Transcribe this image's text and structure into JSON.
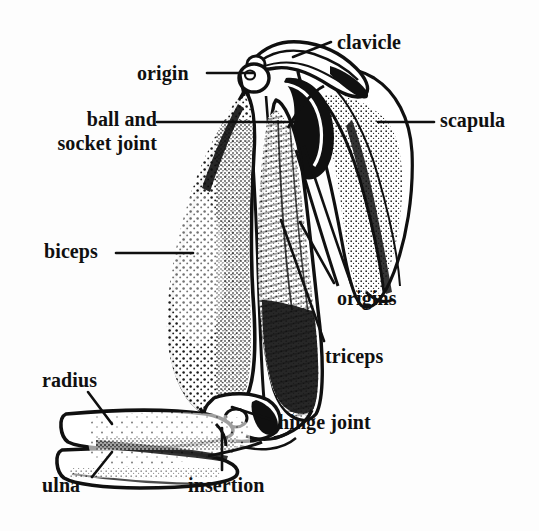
{
  "figure": {
    "style": "black-and-white stipple engraving line drawing",
    "background_color": "#fdfdfd",
    "ink_color": "#101010"
  },
  "labels": [
    {
      "id": "clavicle",
      "text": "clavicle",
      "x": 337,
      "y": 31,
      "leader": "diagonal-down-left",
      "points_to": "clavicle bone at top of shoulder"
    },
    {
      "id": "origin",
      "text": "origin",
      "x": 137,
      "y": 62,
      "leader": "horizontal-right",
      "points_to": "biceps origin on scapula"
    },
    {
      "id": "ball-and-socket-joint",
      "text": "ball and socket joint",
      "line1": "ball and",
      "line2": "socket joint",
      "x": 26,
      "y": 108,
      "leader": "horizontal-right",
      "points_to": "shoulder glenohumeral joint"
    },
    {
      "id": "scapula",
      "text": "scapula",
      "x": 440,
      "y": 109,
      "leader": "horizontal-left",
      "points_to": "scapula blade"
    },
    {
      "id": "biceps",
      "text": "biceps",
      "x": 44,
      "y": 240,
      "leader": "horizontal-right",
      "points_to": "biceps brachii muscle belly"
    },
    {
      "id": "origins",
      "text": "origins",
      "x": 337,
      "y": 287,
      "leader": "diagonal-up-left",
      "points_to": "triceps origins on scapula and humerus"
    },
    {
      "id": "triceps",
      "text": "triceps",
      "x": 325,
      "y": 345,
      "leader": "diagonal-up-left",
      "points_to": "triceps brachii muscle"
    },
    {
      "id": "radius",
      "text": "radius",
      "x": 42,
      "y": 369,
      "leader": "diagonal-down-right",
      "points_to": "radius bone of forearm"
    },
    {
      "id": "hinge-joint",
      "text": "hinge joint",
      "x": 278,
      "y": 411,
      "leader": "diagonal-up-left",
      "points_to": "elbow joint"
    },
    {
      "id": "insertion",
      "text": "insertion",
      "x": 188,
      "y": 474,
      "leader": "vertical-up",
      "points_to": "biceps insertion on radius"
    },
    {
      "id": "ulna",
      "text": "ulna",
      "x": 42,
      "y": 474,
      "leader": "diagonal-up-right",
      "points_to": "ulna bone of forearm"
    }
  ],
  "leader_lines": [
    {
      "id": "clavicle-leader",
      "x1": 331,
      "y1": 42,
      "x2": 293,
      "y2": 57
    },
    {
      "id": "origin-leader",
      "x1": 207,
      "y1": 73,
      "x2": 254,
      "y2": 73
    },
    {
      "id": "ball-socket-leader",
      "x1": 157,
      "y1": 122,
      "x2": 296,
      "y2": 122
    },
    {
      "id": "scapula-leader",
      "x1": 434,
      "y1": 122,
      "x2": 378,
      "y2": 122
    },
    {
      "id": "biceps-leader",
      "x1": 116,
      "y1": 253,
      "x2": 193,
      "y2": 253
    },
    {
      "id": "origins-leader",
      "x1": 334,
      "y1": 283,
      "x2": 300,
      "y2": 222
    },
    {
      "id": "triceps-leader",
      "x1": 324,
      "y1": 341,
      "x2": 281,
      "y2": 220
    },
    {
      "id": "radius-leader",
      "x1": 88,
      "y1": 392,
      "x2": 112,
      "y2": 424
    },
    {
      "id": "hinge-leader",
      "x1": 275,
      "y1": 421,
      "x2": 232,
      "y2": 407
    },
    {
      "id": "insertion-leader",
      "x1": 222,
      "y1": 470,
      "x2": 222,
      "y2": 428
    },
    {
      "id": "ulna-leader",
      "x1": 92,
      "y1": 477,
      "x2": 112,
      "y2": 452
    }
  ]
}
